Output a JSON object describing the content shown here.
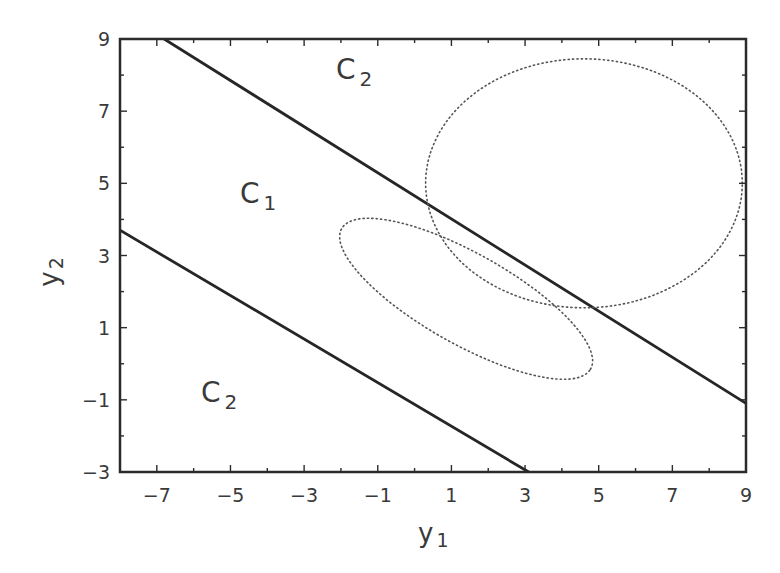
{
  "chart_data": {
    "type": "line",
    "title": "",
    "xlabel": "y1",
    "ylabel": "y2",
    "xlabel_main": "y",
    "xlabel_sub": "1",
    "ylabel_main": "y",
    "ylabel_sub": "2",
    "xlim": [
      -8,
      9
    ],
    "ylim": [
      -3,
      9
    ],
    "grid": false,
    "legend": null,
    "x_ticks": [
      -7,
      -5,
      -3,
      -1,
      1,
      3,
      5,
      7,
      9
    ],
    "x_tick_labels": [
      "−7",
      "−5",
      "−3",
      "−1",
      "1",
      "3",
      "5",
      "7",
      "9"
    ],
    "y_ticks": [
      -3,
      -1,
      1,
      3,
      5,
      7,
      9
    ],
    "y_tick_labels": [
      "−3",
      "−1",
      "1",
      "3",
      "5",
      "7",
      "9"
    ],
    "series": [
      {
        "name": "upper decision boundary",
        "style": "solid",
        "points": [
          [
            -6.8,
            9.0
          ],
          [
            9.0,
            -1.1
          ]
        ]
      },
      {
        "name": "lower decision boundary",
        "style": "solid",
        "points": [
          [
            -8.0,
            3.7
          ],
          [
            3.1,
            -3.0
          ]
        ]
      },
      {
        "name": "class C2 contour ellipse",
        "style": "dotted",
        "center": [
          4.6,
          5.0
        ],
        "rx": 4.3,
        "ry": 3.45,
        "angle_deg": 0
      },
      {
        "name": "class C1 contour ellipse",
        "style": "dotted",
        "center": [
          1.4,
          1.8
        ],
        "rx": 3.9,
        "ry": 1.25,
        "angle_deg": -30
      }
    ],
    "annotations": [
      {
        "text": "C2",
        "main": "C",
        "sub": "2",
        "x": 0.9,
        "y": 7.9
      },
      {
        "text": "C1",
        "main": "C",
        "sub": "1",
        "x": -4.7,
        "y": 4.5
      },
      {
        "text": "C2",
        "main": "C",
        "sub": "2",
        "x": -5.6,
        "y": -1.0
      }
    ]
  }
}
